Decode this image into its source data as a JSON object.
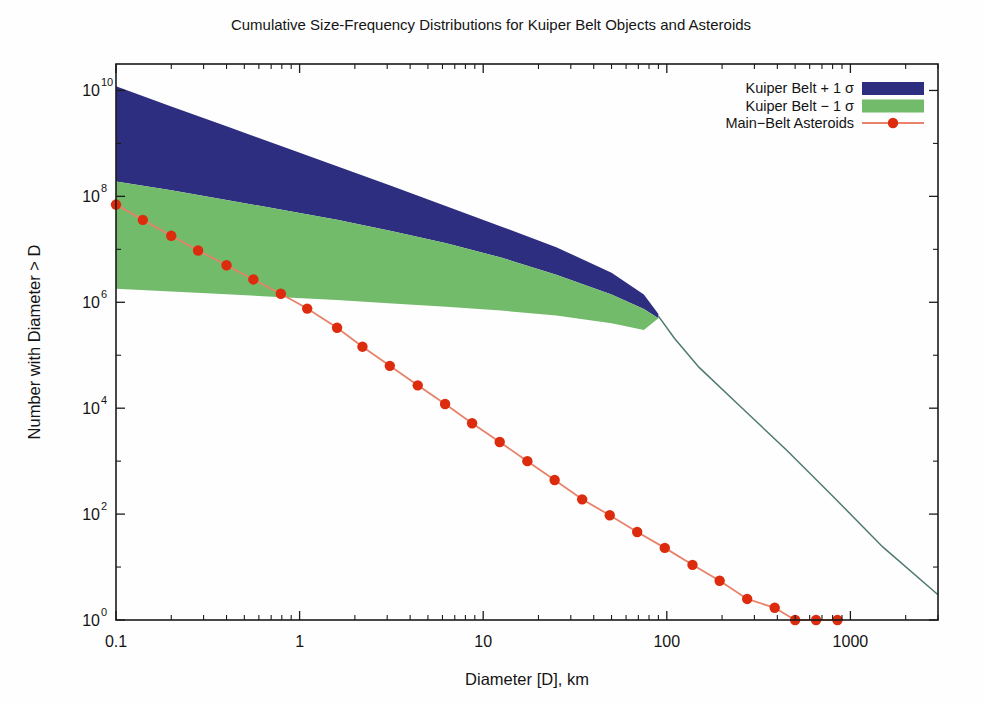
{
  "chart_data": {
    "type": "area",
    "title": "Cumulative Size-Frequency Distributions for Kuiper Belt Objects and Asteroids",
    "xlabel": "Diameter [D], km",
    "ylabel": "Number with Diameter > D",
    "xscale": "log",
    "yscale": "log",
    "xlim": [
      0.1,
      3000
    ],
    "ylim": [
      1,
      31600000000.0
    ],
    "xticks": [
      0.1,
      1,
      10,
      100,
      1000
    ],
    "xticklabels": [
      "0.1",
      "1",
      "10",
      "100",
      "1000"
    ],
    "yticks": [
      1,
      100,
      10000,
      1000000,
      100000000,
      10000000000
    ],
    "yticklabels": [
      "10^0",
      "10^2",
      "10^4",
      "10^6",
      "10^8",
      "10^10"
    ],
    "ytick_mantissa": "10",
    "ytick_exponents": [
      "0",
      "2",
      "4",
      "6",
      "8",
      "10"
    ],
    "grid": false,
    "legend_position": "upper right",
    "series": [
      {
        "name": "Kuiper Belt + 1 σ",
        "kind": "band-upper",
        "color": "#2e2e80",
        "x": [
          0.1,
          0.2,
          0.4,
          0.8,
          1.6,
          3.2,
          6.3,
          12.5,
          25,
          50,
          75,
          90,
          110,
          150,
          250,
          450,
          800,
          1500,
          3000
        ],
        "y": [
          12000000000.0,
          5000000000.0,
          2100000000.0,
          880000000.0,
          370000000.0,
          155000000.0,
          65000000.0,
          27000000.0,
          11000000.0,
          3600000.0,
          1400000.0,
          600000.0,
          220000.0,
          60000.0,
          11000.0,
          1600,
          220,
          24,
          3
        ]
      },
      {
        "name": "Kuiper Belt − 1 σ",
        "kind": "band-lower",
        "color": "#72bb6a",
        "x": [
          0.1,
          0.2,
          0.4,
          0.8,
          1.6,
          3.2,
          6.3,
          12.5,
          25,
          50,
          75,
          90,
          110,
          150,
          250,
          450,
          800,
          1500,
          3000
        ],
        "y": [
          190000000.0,
          130000000.0,
          85000000.0,
          56000000.0,
          36000000.0,
          22000000.0,
          13000000.0,
          7000000.0,
          3300000.0,
          1400000.0,
          750000.0,
          500000.0,
          200000.0,
          58000.0,
          11000.0,
          1600,
          220,
          24,
          3
        ]
      },
      {
        "name": "Main−Belt Asteroids",
        "kind": "line-markers",
        "color": "#dd2b0e",
        "line_color": "#e8826a",
        "marker": "filled-circle",
        "x": [
          0.1,
          0.14,
          0.2,
          0.28,
          0.4,
          0.56,
          0.79,
          1.1,
          1.6,
          2.2,
          3.1,
          4.4,
          6.2,
          8.7,
          12.3,
          17.4,
          24.5,
          34.6,
          48.9,
          69,
          97.5,
          138,
          194,
          274,
          387,
          500,
          650,
          850
        ],
        "y": [
          70000000.0,
          36000000.0,
          18000000.0,
          9500000.0,
          5000000.0,
          2700000.0,
          1450000.0,
          760000.0,
          330000.0,
          145000.0,
          63000.0,
          27000.0,
          12000.0,
          5200,
          2300,
          1000,
          440,
          190,
          95,
          46,
          23,
          11,
          5.5,
          2.5,
          1.7,
          1,
          1,
          1
        ]
      }
    ]
  },
  "legend": {
    "entries": [
      {
        "label": "Kuiper Belt + 1 σ",
        "swatch": "band",
        "color": "#2e2e80"
      },
      {
        "label": "Kuiper Belt − 1 σ",
        "swatch": "band",
        "color": "#72bb6a"
      },
      {
        "label": "Main−Belt Asteroids",
        "swatch": "line-marker",
        "color": "#dd2b0e",
        "line_color": "#e8826a"
      }
    ]
  },
  "colors": {
    "kuiper_upper": "#2e2e80",
    "kuiper_lower": "#72bb6a",
    "asteroid_marker": "#dd2b0e",
    "asteroid_line": "#e8826a",
    "tail_line": "#4e7a72",
    "axis": "#1b1b1b",
    "background": "#fefefe"
  }
}
